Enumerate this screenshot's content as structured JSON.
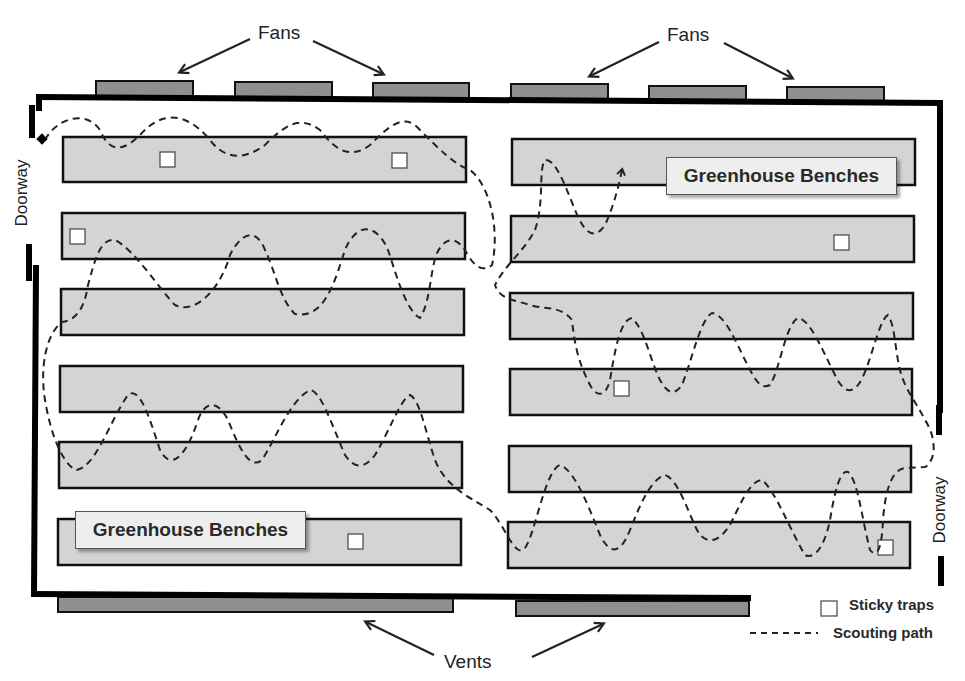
{
  "title_labels": {
    "fans_left": "Fans",
    "fans_right": "Fans",
    "vents": "Vents",
    "doorway_left": "Doorway",
    "doorway_right": "Doorway",
    "bench_label_top": "Greenhouse Benches",
    "bench_label_bottom": "Greenhouse Benches"
  },
  "legend": {
    "sticky_traps": "Sticky traps",
    "scouting_path": "Scouting path"
  },
  "colors": {
    "wall": "#000000",
    "bench_fill": "#d4d4d4",
    "fan_fill": "#8f8f8f",
    "vent_fill": "#8f8f8f",
    "trap_fill": "#ffffff",
    "path": "#222222",
    "callout_fill": "#eeeeee"
  },
  "fans": [
    {
      "x": 96,
      "y": 81,
      "w": 97,
      "h": 15
    },
    {
      "x": 235,
      "y": 82,
      "w": 97,
      "h": 15
    },
    {
      "x": 373,
      "y": 83,
      "w": 96,
      "h": 15
    },
    {
      "x": 511,
      "y": 84,
      "w": 97,
      "h": 15
    },
    {
      "x": 649,
      "y": 86,
      "w": 97,
      "h": 15
    },
    {
      "x": 787,
      "y": 87,
      "w": 97,
      "h": 15
    }
  ],
  "vents": [
    {
      "x": 58,
      "y": 597,
      "w": 395,
      "h": 15
    },
    {
      "x": 516,
      "y": 601,
      "w": 233,
      "h": 15
    }
  ],
  "benches_left": [
    {
      "x": 63,
      "y": 137,
      "w": 403,
      "h": 45
    },
    {
      "x": 62,
      "y": 213,
      "w": 403,
      "h": 46
    },
    {
      "x": 61,
      "y": 289,
      "w": 403,
      "h": 46
    },
    {
      "x": 60,
      "y": 366,
      "w": 403,
      "h": 46
    },
    {
      "x": 59,
      "y": 442,
      "w": 403,
      "h": 46
    },
    {
      "x": 58,
      "y": 519,
      "w": 403,
      "h": 46
    }
  ],
  "benches_right": [
    {
      "x": 512,
      "y": 139,
      "w": 403,
      "h": 46
    },
    {
      "x": 511,
      "y": 216,
      "w": 403,
      "h": 46
    },
    {
      "x": 510,
      "y": 293,
      "w": 403,
      "h": 46
    },
    {
      "x": 510,
      "y": 369,
      "w": 402,
      "h": 46
    },
    {
      "x": 509,
      "y": 446,
      "w": 402,
      "h": 46
    },
    {
      "x": 508,
      "y": 522,
      "w": 402,
      "h": 46
    }
  ],
  "sticky_traps": [
    {
      "x": 160,
      "y": 152
    },
    {
      "x": 392,
      "y": 153
    },
    {
      "x": 70,
      "y": 229
    },
    {
      "x": 834,
      "y": 235
    },
    {
      "x": 614,
      "y": 381
    },
    {
      "x": 348,
      "y": 534
    },
    {
      "x": 878,
      "y": 540
    }
  ],
  "scouting_path_d": "M 45 140 C 55 120, 85 108, 100 130 C 110 155, 125 150, 140 135 C 160 112, 185 110, 210 140 C 225 160, 245 160, 265 145 C 285 125, 300 115, 320 130 C 335 150, 350 160, 370 145 C 390 125, 405 112, 420 130 C 440 150, 455 165, 470 170 C 490 185, 500 230, 492 265 C 480 275, 470 260, 465 250 C 455 235, 445 240, 440 248 C 430 260, 432 300, 420 318 C 405 310, 395 270, 388 250 C 375 220, 355 225, 345 250 C 335 280, 325 320, 295 314 C 280 300, 275 270, 265 250 C 255 225, 240 235, 230 255 C 220 290, 195 315, 175 305 C 160 290, 135 250, 115 240 C 100 238, 95 260, 88 285 C 85 305, 78 320, 62 322 C 45 335, 40 370, 45 400 C 50 430, 60 460, 75 470 C 95 470, 110 420, 128 395 C 140 385, 150 420, 160 450 C 170 470, 185 460, 198 420 C 205 400, 218 400, 228 420 C 240 450, 250 470, 262 460 C 275 440, 290 400, 310 390 C 320 390, 330 420, 345 455 C 355 470, 365 468, 375 455 C 390 430, 400 400, 410 395 C 420 400, 425 430, 435 460 C 445 485, 465 495, 490 510 C 505 525, 515 560, 525 548 C 535 535, 545 470, 560 465 C 575 470, 590 510, 600 535 C 610 555, 620 555, 630 530 C 640 505, 650 480, 665 475 C 680 480, 690 520, 700 535 C 710 545, 720 540, 730 525 C 740 505, 750 480, 762 480 C 775 490, 790 530, 805 555 C 815 560, 825 545, 830 520 C 835 490, 840 470, 848 472 C 858 480, 862 520, 870 550 C 878 560, 882 545, 883 520 C 885 495, 890 470, 905 468 L 925 467 C 935 462, 938 440, 925 420 C 915 400, 905 390, 900 370 C 895 350, 895 325, 888 315 C 878 320, 870 370, 858 385 C 850 395, 842 390, 835 375 C 820 345, 810 320, 798 318 C 785 325, 780 370, 770 385 C 760 390, 755 380, 745 360 C 735 340, 725 315, 712 313 C 700 320, 692 360, 682 385 C 675 395, 668 395, 660 380 C 650 360, 645 330, 632 318 C 620 320, 615 350, 610 380 C 605 400, 595 395, 590 385 C 580 365, 575 350, 572 320 C 560 305, 545 310, 530 305 C 515 300, 500 300, 495 285 C 505 265, 525 250, 535 230 C 545 200, 538 170, 545 160 C 555 158, 565 185, 575 210 C 585 235, 595 240, 605 225 C 612 210, 618 190, 622 170",
  "path_arrow": {
    "x": 622,
    "y": 168
  },
  "doorway_left_marker": {
    "x": 43,
    "y": 140
  }
}
